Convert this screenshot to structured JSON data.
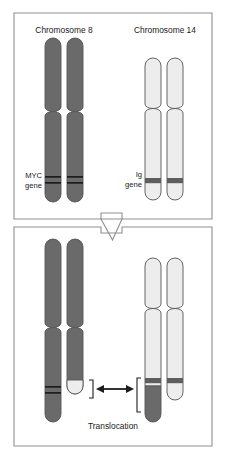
{
  "figure": {
    "title_top_left": "Chromosome 8",
    "title_top_right": "Chromosome 14",
    "gene_label_left_line1": "MYC",
    "gene_label_left_line2": "gene",
    "gene_label_right_line1": "Ig",
    "gene_label_right_line2": "gene",
    "caption_bottom": "Translocation"
  },
  "panels": [
    {
      "name": "normal-chromosomes-panel",
      "order": 1,
      "description_text": "",
      "chromosomes": [
        {
          "name": "chromosome-8-homolog-a",
          "label": "Chromosome 8",
          "arm_color": "#6a6a6a",
          "gene": "MYC"
        },
        {
          "name": "chromosome-8-homolog-b",
          "label": "Chromosome 8",
          "arm_color": "#6a6a6a",
          "gene": "MYC"
        },
        {
          "name": "chromosome-14-homolog-a",
          "label": "Chromosome 14",
          "arm_color": "#ededed",
          "gene": "Ig"
        },
        {
          "name": "chromosome-14-homolog-b",
          "label": "Chromosome 14",
          "arm_color": "#ededed",
          "gene": "Ig"
        }
      ]
    },
    {
      "name": "translocated-chromosomes-panel",
      "order": 2,
      "description_text": "Translocation",
      "chromosomes": [
        {
          "name": "chromosome-8-homolog-a",
          "label": "Chromosome 8",
          "arm_color": "#6a6a6a",
          "gene": "MYC"
        },
        {
          "name": "chromosome-8-derivative",
          "label": "Chromosome 8",
          "arm_color": "#6a6a6a",
          "gene": ""
        },
        {
          "name": "chromosome-14-derivative",
          "label": "Chromosome 14",
          "arm_color": "#ededed",
          "gene": "Ig"
        },
        {
          "name": "chromosome-14-homolog-b",
          "label": "Chromosome 14",
          "arm_color": "#ededed",
          "gene": "Ig"
        }
      ]
    }
  ],
  "colors": {
    "chr8_fill": "#6a6a6a",
    "chr14_fill": "#ededed",
    "band_fill": "#4a4a4a",
    "outline": "#555555",
    "frame": "#8f8f8f",
    "background": "#ffffff",
    "text": "#1a1a1a"
  }
}
